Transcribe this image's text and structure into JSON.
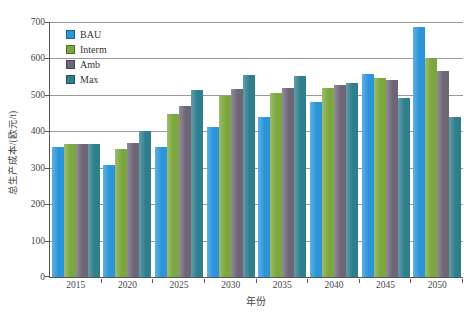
{
  "figure": {
    "background": "#ffffff"
  },
  "chart_data": {
    "type": "bar",
    "title": "",
    "xlabel": "年份",
    "ylabel": "总生产成本/(欧元/t)",
    "categories": [
      "2015",
      "2020",
      "2025",
      "2030",
      "2035",
      "2040",
      "2045",
      "2050"
    ],
    "series": [
      {
        "name": "BAU",
        "color": "#2A95D8",
        "values": [
          358,
          307,
          358,
          413,
          438,
          480,
          557,
          685
        ]
      },
      {
        "name": "Interm",
        "color": "#7BA73E",
        "values": [
          365,
          352,
          448,
          496,
          505,
          518,
          545,
          600
        ]
      },
      {
        "name": "Amb",
        "color": "#6E6677",
        "values": [
          365,
          367,
          470,
          517,
          520,
          527,
          540,
          565
        ]
      },
      {
        "name": "Max",
        "color": "#2E7E8C",
        "values": [
          365,
          400,
          513,
          555,
          553,
          533,
          492,
          440
        ]
      }
    ],
    "ylim": [
      0,
      700
    ],
    "yticks": [
      0,
      100,
      200,
      300,
      400,
      500,
      600,
      700
    ],
    "grid": true,
    "legend_position": "top-left",
    "axis_color": "#555555",
    "grid_color": "#999999",
    "text_color": "#454545"
  }
}
